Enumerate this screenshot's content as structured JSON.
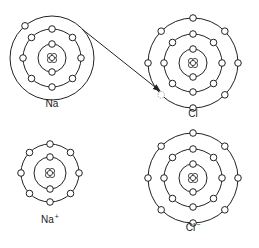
{
  "diagram": {
    "stroke_color": "#222222",
    "background": "#ffffff",
    "atoms": [
      {
        "id": "na",
        "label": "Na",
        "charge": "",
        "center": [
          52,
          58
        ],
        "label_pos": [
          52,
          104
        ],
        "nucleus_radius": 5,
        "shells": [
          {
            "radius": 14,
            "electrons": 2,
            "start_angle": 90
          },
          {
            "radius": 29,
            "electrons": 8,
            "start_angle": 90
          },
          {
            "radius": 42,
            "electrons": 1,
            "start_angle": 130,
            "empty": []
          }
        ]
      },
      {
        "id": "cl",
        "label": "Cl",
        "charge": "",
        "center": [
          193,
          63
        ],
        "label_pos": [
          193,
          114
        ],
        "nucleus_radius": 5,
        "shells": [
          {
            "radius": 14,
            "electrons": 2,
            "start_angle": 90
          },
          {
            "radius": 29,
            "electrons": 8,
            "start_angle": 90
          },
          {
            "radius": 45,
            "electrons": 8,
            "start_angle": 90,
            "empty": [
              5
            ]
          }
        ]
      },
      {
        "id": "na-ion",
        "label": "Na",
        "charge": "+",
        "center": [
          50,
          173
        ],
        "label_pos": [
          50,
          219
        ],
        "nucleus_radius": 5,
        "shells": [
          {
            "radius": 16,
            "electrons": 2,
            "start_angle": 90
          },
          {
            "radius": 29,
            "electrons": 8,
            "start_angle": 90
          }
        ]
      },
      {
        "id": "cl-ion",
        "label": "Cl",
        "charge": "−",
        "center": [
          193,
          178
        ],
        "label_pos": [
          193,
          226
        ],
        "nucleus_radius": 5,
        "shells": [
          {
            "radius": 14,
            "electrons": 2,
            "start_angle": 90
          },
          {
            "radius": 29,
            "electrons": 8,
            "start_angle": 90
          },
          {
            "radius": 45,
            "electrons": 8,
            "start_angle": 90
          }
        ]
      }
    ],
    "transfer_arrow": {
      "from": [
        82,
        29
      ],
      "to": [
        160,
        91
      ],
      "description": "electron transfer from Na to Cl"
    }
  },
  "labels": {
    "na": "Na",
    "cl": "Cl",
    "na_ion": "Na",
    "na_ion_charge": "+",
    "cl_ion": "Cl",
    "cl_ion_charge": "−"
  }
}
